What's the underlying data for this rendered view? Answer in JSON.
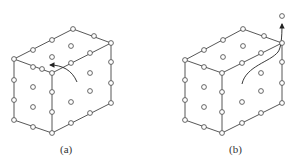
{
  "figure": {
    "panels": [
      {
        "id": "a",
        "caption": "(a)",
        "arrow": "curved arrow from right face into top-front edge, pointing left"
      },
      {
        "id": "b",
        "caption": "(b)",
        "arrow": "curved arrow from right face up to top-back-right corner and beyond, pointing up"
      }
    ]
  },
  "colors": {
    "line": "#444444",
    "node_fill": "#ffffff",
    "background": "#ffffff"
  }
}
